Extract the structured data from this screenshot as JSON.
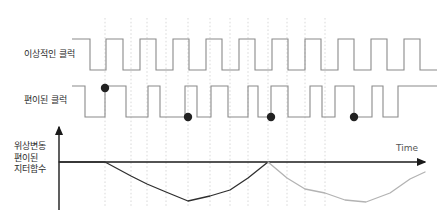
{
  "figure": {
    "title_labels": {
      "ideal_clock": "이상적인 클럭",
      "shifted_clock": "편이된 클럭",
      "jitter_line1": "위상변동",
      "jitter_line2": "편이된",
      "jitter_line3": "지터함수",
      "time_axis": "Time"
    },
    "colors": {
      "waveform": "#8a8a8a",
      "gridline": "#d9d9d9",
      "axis": "#1a1a1a",
      "curve_primary": "#2f2f2f",
      "curve_secondary": "#b3b3b3",
      "marker": "#222222",
      "text": "#2b2b2b",
      "background": "#ffffff"
    }
  },
  "chart_data": {
    "type": "line",
    "title": "",
    "xlabel": "Time",
    "ylabel": "위상변동 편이된 지터함수",
    "grid": true,
    "legend": "none",
    "xlim": [
      59,
      425
    ],
    "ylim": [
      210,
      125
    ],
    "axes": {
      "origin_x": 59,
      "baseline_y": 162,
      "v_axis_top": 127,
      "v_axis_bottom": 210,
      "h_axis_end": 425
    },
    "gridlines_x": [
      105,
      131,
      147,
      166,
      188,
      210,
      230,
      248,
      268,
      287,
      305,
      325
    ],
    "series": [
      {
        "name": "jitter-phase-deviation-primary",
        "color": "#2f2f2f",
        "points": [
          [
            59,
            162
          ],
          [
            105,
            162
          ],
          [
            131,
            176
          ],
          [
            147,
            184
          ],
          [
            166,
            192
          ],
          [
            188,
            201
          ],
          [
            210,
            196
          ],
          [
            230,
            190
          ],
          [
            248,
            178
          ],
          [
            268,
            162
          ]
        ]
      },
      {
        "name": "jitter-phase-deviation-secondary",
        "color": "#b3b3b3",
        "points": [
          [
            268,
            162
          ],
          [
            287,
            178
          ],
          [
            305,
            189
          ],
          [
            325,
            193
          ],
          [
            345,
            200
          ],
          [
            366,
            202
          ],
          [
            390,
            193
          ],
          [
            410,
            179
          ],
          [
            425,
            172
          ]
        ]
      }
    ],
    "markers": [
      {
        "name": "phase-shift-marker-1",
        "x": 105,
        "y": 88
      },
      {
        "name": "phase-shift-marker-2",
        "x": 188,
        "y": 117
      },
      {
        "name": "phase-shift-marker-3",
        "x": 271,
        "y": 117
      },
      {
        "name": "phase-shift-marker-4",
        "x": 354,
        "y": 117
      }
    ],
    "waveforms": [
      {
        "name": "ideal-clock",
        "high_y": 39,
        "low_y": 70,
        "start_x": 72,
        "edges": [
          72,
          90,
          106,
          123,
          140,
          156,
          173,
          189,
          206,
          222,
          239,
          255,
          272,
          288,
          305,
          321,
          338,
          354,
          371,
          387,
          404,
          420
        ],
        "end_x": 437
      },
      {
        "name": "shifted-clock",
        "high_y": 86,
        "low_y": 117,
        "start_x": 72,
        "edges": [
          72,
          85,
          105,
          126,
          148,
          160,
          185,
          197,
          211,
          228,
          248,
          258,
          271,
          288,
          310,
          322,
          335,
          354,
          372,
          383,
          398
        ],
        "end_x": 437
      }
    ]
  }
}
